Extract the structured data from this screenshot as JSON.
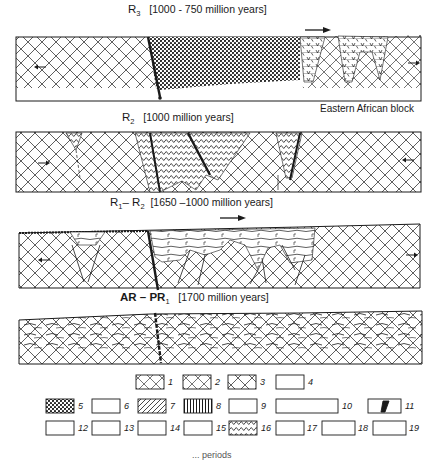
{
  "panels": [
    {
      "id": "r3",
      "symbol": "R",
      "sub": "3",
      "period": "[1000 - 750 million years]"
    },
    {
      "id": "r2",
      "symbol": "R",
      "sub": "2",
      "period": "[1000 million years]"
    },
    {
      "id": "r1r2",
      "symbol": "R",
      "sub": "1",
      "symbol2": "– R",
      "sub2": "2",
      "period": "[1650 –1000 million years]"
    },
    {
      "id": "ar-pr1",
      "symbol": "AR – PR",
      "sub": "1",
      "period": "[1700 million years]"
    }
  ],
  "labels": {
    "eastern_african_block": "Eastern African block",
    "question_mark": "?"
  },
  "legend": {
    "items": [
      "1",
      "2",
      "3",
      "4",
      "5",
      "6",
      "7",
      "8",
      "9",
      "10",
      "11",
      "12",
      "13",
      "14",
      "15",
      "16",
      "17",
      "18",
      "19"
    ],
    "sublabels": {
      "a": "a",
      "b": "b",
      "c": "c",
      "d": "d"
    }
  },
  "caption_partial": "... periods",
  "colors": {
    "ink": "#1a1a1a",
    "paper": "#ffffff"
  }
}
